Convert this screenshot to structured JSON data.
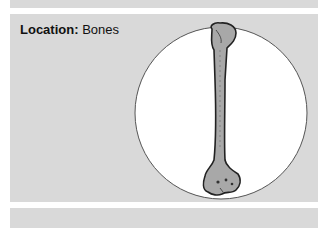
{
  "location": {
    "label": "Location:",
    "value": "Bones"
  },
  "illustration": {
    "subject": "bone-icon",
    "description": "Long bone (humerus) illustration in a white circle"
  },
  "colors": {
    "panel": "#d9d9d9",
    "circle_fill": "#ffffff",
    "circle_stroke": "#555555",
    "bone_fill": "#a8a8a8",
    "bone_stroke": "#222222"
  }
}
